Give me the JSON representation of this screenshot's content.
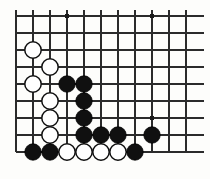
{
  "figure": {
    "kind": "go-board-diagram",
    "background_color": "#fdfdfb",
    "line_color": "#2b2b2b",
    "black_stone_color": "#101010",
    "white_stone_color": "#ffffff"
  },
  "board": {
    "origin_x": 16,
    "origin_y": 16,
    "spacing": 17,
    "columns": 11,
    "rows": 9,
    "left_edge_is_board_edge": true,
    "bottom_edge_is_board_edge": true,
    "top_edge_is_board_edge": false,
    "right_edge_is_board_edge": false,
    "stone_radius": 8.2
  },
  "star_points": [
    {
      "col": 3,
      "row": 0
    },
    {
      "col": 8,
      "row": 0
    },
    {
      "col": 8,
      "row": 6
    }
  ],
  "stones": [
    {
      "color": "white",
      "col": 1,
      "row": 2
    },
    {
      "color": "white",
      "col": 2,
      "row": 3
    },
    {
      "color": "white",
      "col": 1,
      "row": 4
    },
    {
      "color": "black",
      "col": 3,
      "row": 4
    },
    {
      "color": "black",
      "col": 4,
      "row": 4
    },
    {
      "color": "white",
      "col": 2,
      "row": 5
    },
    {
      "color": "black",
      "col": 4,
      "row": 5
    },
    {
      "color": "white",
      "col": 2,
      "row": 6
    },
    {
      "color": "black",
      "col": 4,
      "row": 6
    },
    {
      "color": "white",
      "col": 2,
      "row": 7
    },
    {
      "color": "black",
      "col": 4,
      "row": 7
    },
    {
      "color": "black",
      "col": 5,
      "row": 7
    },
    {
      "color": "black",
      "col": 6,
      "row": 7
    },
    {
      "color": "black",
      "col": 8,
      "row": 7
    },
    {
      "color": "black",
      "col": 1,
      "row": 8
    },
    {
      "color": "black",
      "col": 2,
      "row": 8
    },
    {
      "color": "white",
      "col": 3,
      "row": 8
    },
    {
      "color": "white",
      "col": 4,
      "row": 8
    },
    {
      "color": "white",
      "col": 5,
      "row": 8
    },
    {
      "color": "white",
      "col": 6,
      "row": 8
    },
    {
      "color": "black",
      "col": 7,
      "row": 8
    }
  ]
}
